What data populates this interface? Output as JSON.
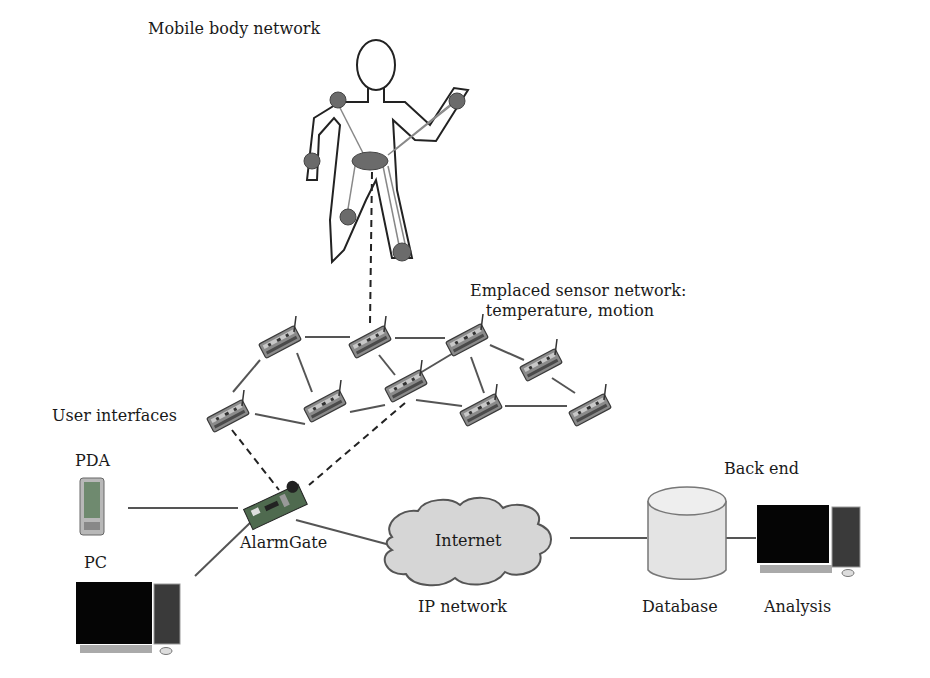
{
  "diagram": {
    "labels": {
      "mobile_body_network": "Mobile body network",
      "emplaced_sensor_network_line1": "Emplaced sensor network:",
      "emplaced_sensor_network_line2": "temperature, motion",
      "user_interfaces": "User interfaces",
      "pda": "PDA",
      "pc": "PC",
      "alarmgate": "AlarmGate",
      "internet": "Internet",
      "ip_network": "IP network",
      "back_end": "Back end",
      "database": "Database",
      "analysis": "Analysis"
    },
    "icons": {
      "body": "human-figure-icon",
      "sensor": "sensor-node-icon",
      "gateway": "circuit-board-icon",
      "pda": "pda-icon",
      "pc": "desktop-computer-icon",
      "cloud": "cloud-icon",
      "database": "database-cylinder-icon"
    },
    "colors": {
      "line": "#555555",
      "sensor_dot": "#6b6b6b",
      "cloud_fill": "#d6d6d6",
      "db_fill": "#e4e4e4"
    }
  }
}
